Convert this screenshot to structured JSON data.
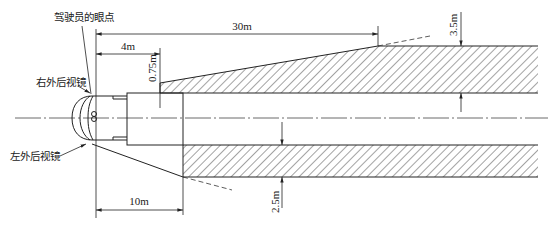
{
  "diagram": {
    "labels": {
      "driver_eye_point": "驾驶员的眼点",
      "right_mirror": "右外后视镜",
      "left_mirror": "左外后视镜"
    },
    "dimensions": {
      "d_30m": "30m",
      "d_4m": "4m",
      "d_075m": "0.75m",
      "d_35m": "3.5m",
      "d_25m": "2.5m",
      "d_10m": "10m"
    },
    "colors": {
      "line": "#222222",
      "hatch": "#333333",
      "background": "#ffffff"
    }
  }
}
